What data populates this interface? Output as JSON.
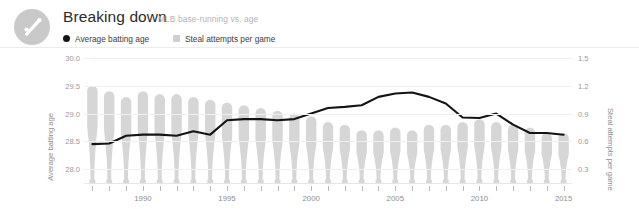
{
  "header": {
    "logo_icon": "baseball-bat-and-ball-icon",
    "title": "Breaking down",
    "subtitle": "MLB base-running vs. age",
    "legend": [
      {
        "label": "Average batting age",
        "marker": "dot",
        "color": "#141414"
      },
      {
        "label": "Steal attempts per game",
        "marker": "square",
        "color": "#cfcfcf"
      }
    ]
  },
  "chart_data": {
    "type": "bar",
    "title": "Breaking down",
    "subtitle": "MLB base-running vs. age",
    "xlabel": "",
    "ylabel": "Average batting age",
    "y2label": "Steal attempts per game",
    "grid": true,
    "legend_position": "top-left",
    "ylim": [
      27.75,
      30.0
    ],
    "y2lim": [
      0.15,
      1.5
    ],
    "yticks": [
      "30.0",
      "29.5",
      "29.0",
      "28.5",
      "28.0"
    ],
    "ytick_values": [
      30.0,
      29.5,
      29.0,
      28.5,
      28.0
    ],
    "y2ticks": [
      "1.5",
      "1.2",
      "0.9",
      "0.6",
      "0.3"
    ],
    "y2tick_values": [
      1.5,
      1.2,
      0.9,
      0.6,
      0.3
    ],
    "x": [
      1987,
      1988,
      1989,
      1990,
      1991,
      1992,
      1993,
      1994,
      1995,
      1996,
      1997,
      1998,
      1999,
      2000,
      2001,
      2002,
      2003,
      2004,
      2005,
      2006,
      2007,
      2008,
      2009,
      2010,
      2011,
      2012,
      2013,
      2014,
      2015
    ],
    "xtick_labels": [
      "1990",
      "1995",
      "2000",
      "2005",
      "2010",
      "2015"
    ],
    "xtick_label_values": [
      1990,
      1995,
      2000,
      2005,
      2010,
      2015
    ],
    "series": [
      {
        "name": "Steal attempts per game",
        "type": "bar",
        "axis": "right",
        "color": "#d6d6d6",
        "values": [
          1.2,
          1.14,
          1.08,
          1.14,
          1.11,
          1.11,
          1.08,
          1.05,
          1.02,
          0.99,
          0.96,
          0.93,
          0.9,
          0.87,
          0.81,
          0.78,
          0.72,
          0.72,
          0.75,
          0.72,
          0.78,
          0.78,
          0.81,
          0.84,
          0.81,
          0.78,
          0.75,
          0.69,
          0.69
        ]
      },
      {
        "name": "Average batting age",
        "type": "line",
        "axis": "left",
        "color": "#141414",
        "values": [
          28.45,
          28.46,
          28.6,
          28.62,
          28.62,
          28.6,
          28.68,
          28.62,
          28.88,
          28.9,
          28.9,
          28.88,
          28.9,
          29.0,
          29.1,
          29.12,
          29.15,
          29.3,
          29.36,
          29.38,
          29.3,
          29.18,
          28.93,
          28.92,
          29.0,
          28.8,
          28.65,
          28.65,
          28.62
        ]
      }
    ]
  }
}
